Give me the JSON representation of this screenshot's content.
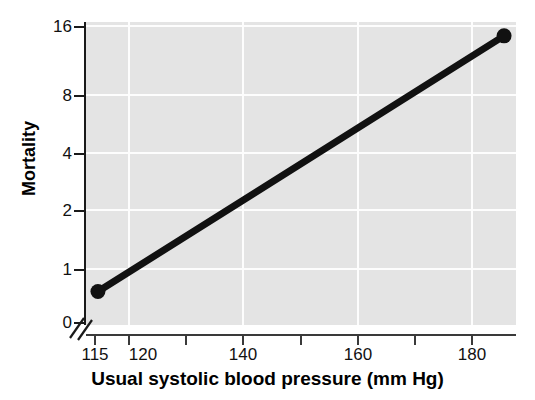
{
  "chart_data": {
    "type": "line",
    "title": "",
    "xlabel": "Usual systolic blood pressure (mm Hg)",
    "ylabel": "Mortality",
    "x": [
      115,
      183
    ],
    "values": [
      0.85,
      14.5
    ],
    "series": [
      {
        "name": "Mortality vs usual systolic blood pressure",
        "x": [
          115,
          183
        ],
        "values": [
          0.85,
          14.5
        ],
        "color": "#111111",
        "marker": "filled-circle"
      }
    ],
    "xlim": [
      113,
      185
    ],
    "ylim": [
      0,
      19
    ],
    "yscale": "log",
    "xscale": "linear",
    "grid": true,
    "legend": false,
    "legend_position": "none",
    "axis_break": "y-axis break between 0 and 1",
    "xticks": [
      115,
      120,
      130,
      140,
      150,
      160,
      170,
      180
    ],
    "xtick_labels": [
      "115",
      "120",
      "",
      "140",
      "",
      "160",
      "",
      "180"
    ],
    "yticks": [
      0,
      1,
      2,
      4,
      8,
      16
    ],
    "ytick_labels": [
      "0",
      "1",
      "2",
      "4",
      "8",
      "16"
    ],
    "plot_background": "#e4e4e4",
    "gridline_color": "#fdfdfd",
    "annotations": []
  },
  "axes": {
    "y_title": "Mortality",
    "x_title": "Usual systolic blood pressure (mm Hg)",
    "y_ticks": [
      {
        "label": "16",
        "value": 16
      },
      {
        "label": "8",
        "value": 8
      },
      {
        "label": "4",
        "value": 4
      },
      {
        "label": "2",
        "value": 2
      },
      {
        "label": "1",
        "value": 1
      },
      {
        "label": "0",
        "value": 0
      }
    ],
    "x_ticks": [
      {
        "label": "115",
        "value": 115
      },
      {
        "label": "120",
        "value": 120
      },
      {
        "label": "",
        "value": 130
      },
      {
        "label": "140",
        "value": 140
      },
      {
        "label": "",
        "value": 150
      },
      {
        "label": "160",
        "value": 160
      },
      {
        "label": "",
        "value": 170
      },
      {
        "label": "180",
        "value": 180
      }
    ]
  },
  "colors": {
    "plot_background": "#e4e4e4",
    "gridline": "#fdfdfd",
    "line": "#111111",
    "axis": "#1a1a1a",
    "text": "#111111"
  }
}
